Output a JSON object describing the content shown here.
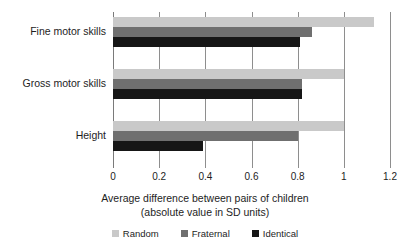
{
  "chart_data": {
    "type": "bar",
    "orientation": "horizontal",
    "title": "",
    "xlabel": "Average difference between pairs of children (absolute value in SD units)",
    "xlabel_line1": "Average difference between pairs of children",
    "xlabel_line2": "(absolute value in SD units)",
    "ylabel": "",
    "categories": [
      "Fine motor skills",
      "Gross motor skills",
      "Height"
    ],
    "series": [
      {
        "name": "Random",
        "color": "#c9c9c9",
        "values": [
          1.13,
          1.0,
          1.0
        ]
      },
      {
        "name": "Fraternal",
        "color": "#6f6f6f",
        "values": [
          0.86,
          0.82,
          0.8
        ]
      },
      {
        "name": "Identical",
        "color": "#161616",
        "values": [
          0.81,
          0.82,
          0.39
        ]
      }
    ],
    "xlim": [
      0,
      1.2
    ],
    "xticks": [
      0,
      0.2,
      0.4,
      0.6,
      0.8,
      1,
      1.2
    ],
    "xtick_labels": [
      "0",
      "0.2",
      "0.4",
      "0.6",
      "0.8",
      "1",
      "1.2"
    ],
    "grid": "vertical",
    "legend_position": "bottom"
  },
  "legend": {
    "items": [
      {
        "label": "Random"
      },
      {
        "label": "Fraternal"
      },
      {
        "label": "Identical"
      }
    ]
  }
}
